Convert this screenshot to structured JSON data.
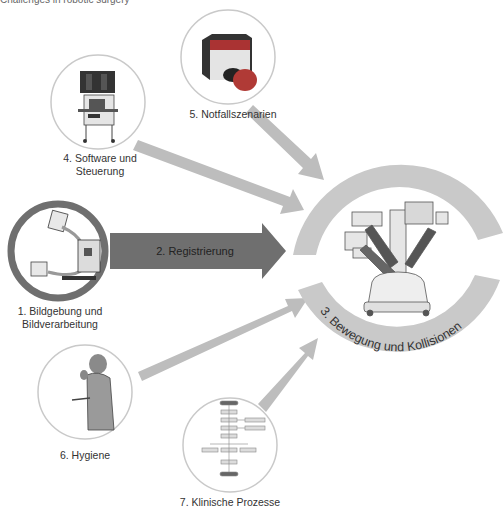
{
  "diagram": {
    "title_cut": "Challenges in robotic surgery",
    "center": {
      "label": "3. Bewegung und Kollisionen",
      "icon": "surgical-robot-icon",
      "ring_color": "#c8c8c8"
    },
    "nodes": [
      {
        "id": "1",
        "label_line1": "1. Bildgebung und",
        "label_line2": "Bildverarbeitung",
        "icon": "c-arm-icon",
        "highlighted": true
      },
      {
        "id": "2",
        "label": "2. Registrierung",
        "type": "arrow",
        "color": "#6e6e6e"
      },
      {
        "id": "4",
        "label_line1": "4. Software und",
        "label_line2": "Steuerung",
        "icon": "computer-cart-icon"
      },
      {
        "id": "5",
        "label": "5. Notfallszenarien",
        "icon": "emergency-button-icon"
      },
      {
        "id": "6",
        "label": "6. Hygiene",
        "icon": "surgeon-icon"
      },
      {
        "id": "7",
        "label": "7. Klinische Prozesse",
        "icon": "flowchart-icon"
      }
    ],
    "colors": {
      "arrow_light": "#bdbdbd",
      "arrow_dark": "#6f6f6f",
      "circle_border": "#c9c9c9",
      "highlight_border": "#6f6f6f",
      "button_red": "#b03a36"
    }
  }
}
